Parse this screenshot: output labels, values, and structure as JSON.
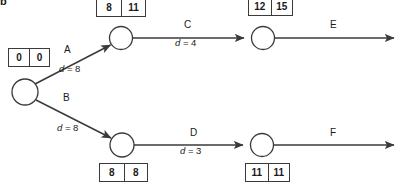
{
  "figure": {
    "label": "b",
    "type": "activity-on-arrow-network-diagram",
    "width": 398,
    "height": 185,
    "background": "#ffffff",
    "line_color": "#3a3a3a",
    "text_color": "#1a1a1a"
  },
  "nodes": [
    {
      "id": "start",
      "cx": 25,
      "cy": 92,
      "r": 13,
      "box": {
        "x": 8,
        "y": 48,
        "w": 42,
        "h": 19,
        "early": "0",
        "late": "0"
      }
    },
    {
      "id": "n-top-left",
      "cx": 121,
      "cy": 38,
      "r": 11.5,
      "box": {
        "x": 96,
        "y": 0,
        "w": 50,
        "h": 18,
        "early": "8",
        "late": "11"
      }
    },
    {
      "id": "n-bottom-left",
      "cx": 122,
      "cy": 145,
      "r": 12,
      "box": {
        "x": 99,
        "y": 163,
        "w": 49,
        "h": 19,
        "early": "8",
        "late": "8"
      }
    },
    {
      "id": "n-top-right",
      "cx": 263,
      "cy": 38,
      "r": 11.5,
      "box": {
        "x": 248,
        "y": 0,
        "w": 45,
        "h": 17,
        "early": "12",
        "late": "15"
      }
    },
    {
      "id": "n-bottom-right",
      "cx": 262,
      "cy": 145,
      "r": 11.5,
      "box": {
        "x": 245,
        "y": 163,
        "w": 45,
        "h": 19,
        "early": "11",
        "late": "11"
      }
    }
  ],
  "edges": [
    {
      "id": "edge-a",
      "label": "A",
      "duration_text": "d = 8",
      "duration_value": 8,
      "from": "start",
      "to": "n-top-left",
      "label_pos": {
        "x": 64,
        "y": 44
      },
      "dur_pos": {
        "x": 59,
        "y": 63
      }
    },
    {
      "id": "edge-b",
      "label": "B",
      "duration_text": "d = 8",
      "duration_value": 8,
      "from": "start",
      "to": "n-bottom-left",
      "label_pos": {
        "x": 63,
        "y": 92
      },
      "dur_pos": {
        "x": 57,
        "y": 122
      }
    },
    {
      "id": "edge-c",
      "label": "C",
      "duration_text": "d = 4",
      "duration_value": 4,
      "from": "n-top-left",
      "to": "n-top-right",
      "label_pos": {
        "x": 184,
        "y": 19
      },
      "dur_pos": {
        "x": 175,
        "y": 37
      }
    },
    {
      "id": "edge-d",
      "label": "D",
      "duration_text": "d = 3",
      "duration_value": 3,
      "from": "n-bottom-left",
      "to": "n-bottom-right",
      "label_pos": {
        "x": 190,
        "y": 127
      },
      "dur_pos": {
        "x": 180,
        "y": 145
      }
    },
    {
      "id": "edge-e",
      "label": "E",
      "duration_text": "",
      "from": "n-top-right",
      "to": "exit-top",
      "label_pos": {
        "x": 330,
        "y": 19
      },
      "dur_pos": null
    },
    {
      "id": "edge-f",
      "label": "F",
      "duration_text": "",
      "from": "n-bottom-right",
      "to": "exit-bottom",
      "label_pos": {
        "x": 330,
        "y": 127
      },
      "dur_pos": null
    }
  ]
}
